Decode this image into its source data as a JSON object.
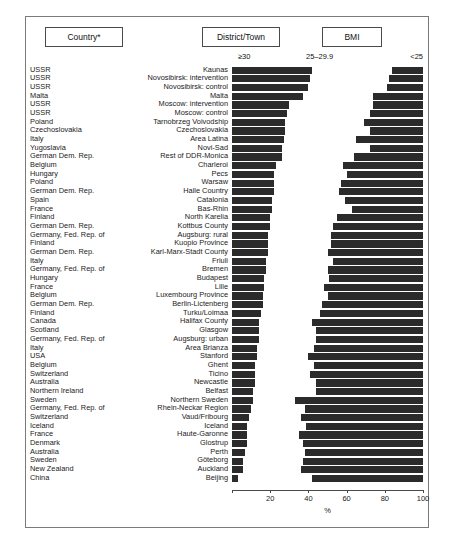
{
  "headers": {
    "country": "Country*",
    "district": "District/Town",
    "bmi": "BMI"
  },
  "legend": {
    "obese": "≥30",
    "overweight": "25–29.9",
    "normal": "<25"
  },
  "axis": {
    "xlabel": "%",
    "ticks": [
      "0",
      "20",
      "40",
      "60",
      "80",
      "100"
    ]
  },
  "chart_data": {
    "type": "bar",
    "orientation": "horizontal",
    "stacked": true,
    "title": "BMI",
    "xlabel": "%",
    "ylabel": "",
    "xlim": [
      0,
      100
    ],
    "grid": false,
    "legend_position": "top",
    "series": [
      {
        "name": "≥30",
        "color": "#2b2b2b"
      },
      {
        "name": "25–29.9",
        "color": "#ffffff"
      },
      {
        "name": "<25",
        "color": "#2b2b2b"
      }
    ],
    "columns": [
      "Country*",
      "District/Town",
      "≥30",
      "25–29.9",
      "<25"
    ],
    "rows": [
      {
        "country": "USSR",
        "district": "Kaunas",
        "obese": 42,
        "overweight": 42,
        "normal": 16
      },
      {
        "country": "USSR",
        "district": "Novosibirsk: intervention",
        "obese": 41,
        "overweight": 41,
        "normal": 18
      },
      {
        "country": "USSR",
        "district": "Novosibirsk: control",
        "obese": 40,
        "overweight": 41,
        "normal": 19
      },
      {
        "country": "Malta",
        "district": "Malta",
        "obese": 37,
        "overweight": 37,
        "normal": 26
      },
      {
        "country": "USSR",
        "district": "Moscow: intervention",
        "obese": 30,
        "overweight": 44,
        "normal": 26
      },
      {
        "country": "USSR",
        "district": "Moscow: control",
        "obese": 29,
        "overweight": 43,
        "normal": 28
      },
      {
        "country": "Poland",
        "district": "Tarnobrzeg Voivodship",
        "obese": 28,
        "overweight": 41,
        "normal": 31
      },
      {
        "country": "Czechoslovakia",
        "district": "Czechoslovakia",
        "obese": 28,
        "overweight": 44,
        "normal": 28
      },
      {
        "country": "Italy",
        "district": "Area Latina",
        "obese": 27,
        "overweight": 38,
        "normal": 35
      },
      {
        "country": "Yugoslavia",
        "district": "Novi-Sad",
        "obese": 26,
        "overweight": 46,
        "normal": 28
      },
      {
        "country": "German Dem. Rep.",
        "district": "Rest of DDR-Monica",
        "obese": 26,
        "overweight": 38,
        "normal": 36
      },
      {
        "country": "Belgium",
        "district": "Charleroi",
        "obese": 23,
        "overweight": 35,
        "normal": 42
      },
      {
        "country": "Hungary",
        "district": "Pecs",
        "obese": 22,
        "overweight": 38,
        "normal": 40
      },
      {
        "country": "Poland",
        "district": "Warsaw",
        "obese": 22,
        "overweight": 35,
        "normal": 43
      },
      {
        "country": "German Dem. Rep.",
        "district": "Halle Country",
        "obese": 22,
        "overweight": 34,
        "normal": 44
      },
      {
        "country": "Spain",
        "district": "Catalonia",
        "obese": 21,
        "overweight": 38,
        "normal": 41
      },
      {
        "country": "France",
        "district": "Bas-Rhin",
        "obese": 21,
        "overweight": 42,
        "normal": 37
      },
      {
        "country": "Finland",
        "district": "North Karelia",
        "obese": 20,
        "overweight": 35,
        "normal": 45
      },
      {
        "country": "German Dem. Rep.",
        "district": "Kottbus County",
        "obese": 20,
        "overweight": 33,
        "normal": 47
      },
      {
        "country": "Germany, Fed. Rep. of",
        "district": "Augsburg: rural",
        "obese": 19,
        "overweight": 33,
        "normal": 48
      },
      {
        "country": "Finland",
        "district": "Kuopio Province",
        "obese": 19,
        "overweight": 33,
        "normal": 48
      },
      {
        "country": "German Dem. Rep.",
        "district": "Karl-Marx-Stadt County",
        "obese": 19,
        "overweight": 31,
        "normal": 50
      },
      {
        "country": "Italy",
        "district": "Friuli",
        "obese": 18,
        "overweight": 35,
        "normal": 47
      },
      {
        "country": "Germany, Fed. Rep. of",
        "district": "Bremen",
        "obese": 18,
        "overweight": 32,
        "normal": 50
      },
      {
        "country": "Hungary",
        "district": "Budapest",
        "obese": 17,
        "overweight": 34,
        "normal": 49
      },
      {
        "country": "France",
        "district": "Lille",
        "obese": 17,
        "overweight": 31,
        "normal": 52
      },
      {
        "country": "Belgium",
        "district": "Luxembourg Province",
        "obese": 16,
        "overweight": 34,
        "normal": 50
      },
      {
        "country": "German Dem. Rep.",
        "district": "Berlin-Lictenberg",
        "obese": 16,
        "overweight": 31,
        "normal": 53
      },
      {
        "country": "Finland",
        "district": "Turku/Loimaa",
        "obese": 15,
        "overweight": 31,
        "normal": 54
      },
      {
        "country": "Canada",
        "district": "Halifax County",
        "obese": 14,
        "overweight": 28,
        "normal": 58
      },
      {
        "country": "Scotland",
        "district": "Glasgow",
        "obese": 14,
        "overweight": 30,
        "normal": 56
      },
      {
        "country": "Germany, Fed. Rep. of",
        "district": "Augsburg: urban",
        "obese": 14,
        "overweight": 30,
        "normal": 56
      },
      {
        "country": "Italy",
        "district": "Area Brianza",
        "obese": 13,
        "overweight": 30,
        "normal": 57
      },
      {
        "country": "USA",
        "district": "Stanford",
        "obese": 13,
        "overweight": 27,
        "normal": 60
      },
      {
        "country": "Belgium",
        "district": "Ghent",
        "obese": 12,
        "overweight": 31,
        "normal": 57
      },
      {
        "country": "Switzerland",
        "district": "Ticino",
        "obese": 12,
        "overweight": 29,
        "normal": 59
      },
      {
        "country": "Australia",
        "district": "Newcastle",
        "obese": 12,
        "overweight": 32,
        "normal": 56
      },
      {
        "country": "Northern Ireland",
        "district": "Belfast",
        "obese": 11,
        "overweight": 33,
        "normal": 56
      },
      {
        "country": "Sweden",
        "district": "Northern Sweden",
        "obese": 11,
        "overweight": 22,
        "normal": 67
      },
      {
        "country": "Germany, Fed. Rep. of",
        "district": "Rhein-Neckar Region",
        "obese": 10,
        "overweight": 28,
        "normal": 62
      },
      {
        "country": "Switzerland",
        "district": "Vaud/Fribourg",
        "obese": 9,
        "overweight": 27,
        "normal": 64
      },
      {
        "country": "Iceland",
        "district": "Iceland",
        "obese": 8,
        "overweight": 31,
        "normal": 61
      },
      {
        "country": "France",
        "district": "Haute-Garonne",
        "obese": 8,
        "overweight": 27,
        "normal": 65
      },
      {
        "country": "Denmark",
        "district": "Glostrup",
        "obese": 8,
        "overweight": 29,
        "normal": 63
      },
      {
        "country": "Australia",
        "district": "Perth",
        "obese": 7,
        "overweight": 31,
        "normal": 62
      },
      {
        "country": "Sweden",
        "district": "Göteborg",
        "obese": 6,
        "overweight": 31,
        "normal": 63
      },
      {
        "country": "New Zealand",
        "district": "Auckland",
        "obese": 6,
        "overweight": 30,
        "normal": 64
      },
      {
        "country": "China",
        "district": "Beijing",
        "obese": 3,
        "overweight": 39,
        "normal": 58
      }
    ]
  }
}
